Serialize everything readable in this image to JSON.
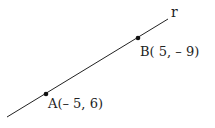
{
  "line": {
    "label": "r",
    "x1": 7,
    "y1": 117,
    "x2": 168,
    "y2": 19,
    "color": "#222222"
  },
  "points": [
    {
      "name": "A",
      "label": "A(– 5, 6)",
      "x": 46,
      "y": 94
    },
    {
      "name": "B",
      "label": "B( 5, – 9)",
      "x": 138,
      "y": 38
    }
  ]
}
